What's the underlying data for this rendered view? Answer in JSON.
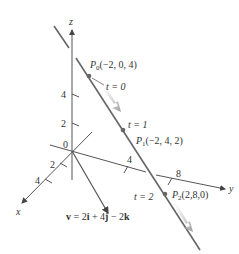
{
  "axes": {
    "x_label": "x",
    "y_label": "y",
    "z_label": "z",
    "origin_label": "0",
    "x_ticks": [
      "2",
      "4"
    ],
    "y_ticks": [
      "4",
      "8"
    ],
    "z_ticks": [
      "4",
      "2"
    ]
  },
  "points": [
    {
      "name": "P",
      "sub": "0",
      "coords": "(−2, 0, 4)",
      "param": "t = 0"
    },
    {
      "name": "P",
      "sub": "1",
      "coords": "(−2, 4, 2)",
      "param": "t = 1"
    },
    {
      "name": "P",
      "sub": "2",
      "coords": "(2,8,0)",
      "param": "t = 2"
    }
  ],
  "vector": {
    "label_v": "v",
    "label_eq": " = 2",
    "i": "i",
    "plus4": " + 4",
    "j": "j",
    "minus2": " − 2",
    "k": "k"
  },
  "colors": {
    "line": "#555555",
    "axis": "#444444",
    "arrow_shade": "#aaaaaa",
    "point": "#666666"
  }
}
